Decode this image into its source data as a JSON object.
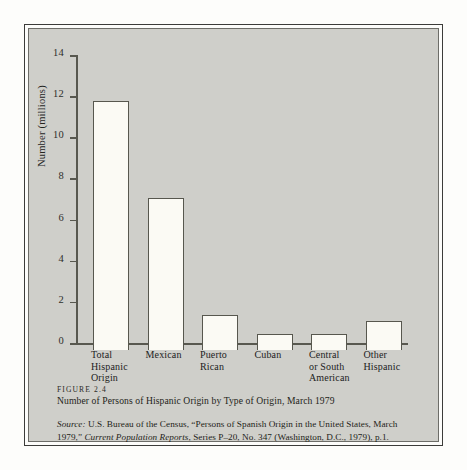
{
  "figure": {
    "number_label": "FIGURE 2.4",
    "title": "Number of Persons of Hispanic Origin by Type of Origin, March 1979",
    "source_label": "Source:",
    "source_text_1": " U.S. Bureau of the Census, “Persons of Spanish Origin in the United States, March 1979,” ",
    "source_italic": "Current Population Reports",
    "source_text_2": ", Series P–20, No. 347 (Washington, D.C., 1979), p.1."
  },
  "chart_data": {
    "type": "bar",
    "title": "Number of Persons of Hispanic Origin by Type of Origin, March 1979",
    "xlabel": "",
    "ylabel": "Number (millions)",
    "ylim": [
      0,
      14
    ],
    "yticks": [
      0,
      2,
      4,
      6,
      8,
      10,
      12,
      14
    ],
    "ytick_labels": [
      "0",
      "2",
      "4",
      "6",
      "8",
      "10",
      "12",
      "14"
    ],
    "grid": false,
    "legend": false,
    "categories": [
      "Total Hispanic Origin",
      "Mexican",
      "Puerto Rican",
      "Cuban",
      "Central or South American",
      "Other Hispanic"
    ],
    "category_lines": [
      [
        "Total",
        "Hispanic",
        "Origin"
      ],
      [
        "Mexican"
      ],
      [
        "Puerto",
        "Rican"
      ],
      [
        "Cuban"
      ],
      [
        "Central",
        "or South",
        "American"
      ],
      [
        "Other",
        "Hispanic"
      ]
    ],
    "values": [
      12.1,
      7.4,
      1.7,
      0.8,
      0.8,
      1.4
    ],
    "units": "millions",
    "bar_fill": "#fbfaf4",
    "bar_edge": "#57574e",
    "plate_color": "#cfcfca"
  }
}
